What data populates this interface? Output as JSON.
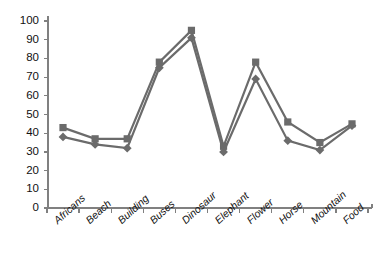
{
  "chart_data": {
    "type": "line",
    "title": "",
    "subtitle": "",
    "xlabel": "",
    "ylabel": "",
    "categories": [
      "Africans",
      "Beach",
      "Building",
      "Buses",
      "Dinosaur",
      "Elephant",
      "Flower",
      "Horse",
      "Mountain",
      "Food"
    ],
    "series": [
      {
        "name": "series-1",
        "marker": "square",
        "color": "#6b6b6b",
        "values": [
          43,
          37,
          37,
          78,
          95,
          33,
          78,
          46,
          35,
          45
        ]
      },
      {
        "name": "series-2",
        "marker": "diamond",
        "color": "#6b6b6b",
        "values": [
          38,
          34,
          32,
          75,
          91,
          30,
          69,
          36,
          31,
          44
        ]
      }
    ],
    "ylim": [
      0,
      100
    ],
    "ytick_values": [
      0,
      10,
      20,
      30,
      40,
      50,
      60,
      70,
      80,
      90,
      100
    ],
    "ytick_labels": [
      "0",
      "10",
      "20",
      "30",
      "40",
      "50",
      "60",
      "70",
      "80",
      "90",
      "100"
    ],
    "grid": false,
    "legend": "none",
    "axis_color": "#808080",
    "line_color": "#6b6b6b",
    "background": "#ffffff"
  }
}
